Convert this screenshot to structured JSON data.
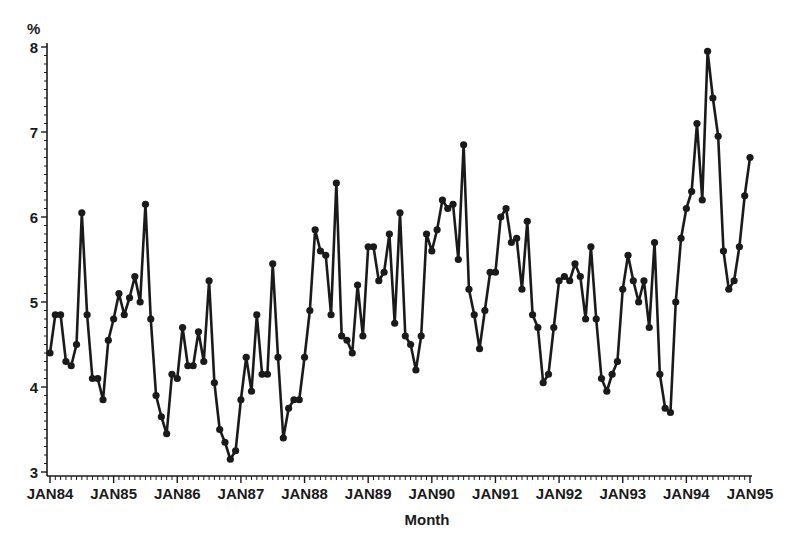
{
  "chart_data": {
    "type": "line",
    "title": "",
    "xlabel": "Month",
    "ylabel": "%",
    "ylim": [
      3,
      8
    ],
    "xlim": [
      "JAN84",
      "JAN95"
    ],
    "grid": false,
    "legend": null,
    "marker": "circle",
    "line_color": "#1a1a1a",
    "y_ticks": [
      3,
      4,
      5,
      6,
      7,
      8
    ],
    "y_minor_ticks_per_unit": 10,
    "x_tick_labels": [
      "JAN84",
      "JAN85",
      "JAN86",
      "JAN87",
      "JAN88",
      "JAN89",
      "JAN90",
      "JAN91",
      "JAN92",
      "JAN93",
      "JAN94",
      "JAN95"
    ],
    "x_minor_ticks_per_year": 12,
    "x_start": "JAN84",
    "x_frequency": "monthly",
    "series": [
      {
        "name": "%",
        "values": [
          4.4,
          4.85,
          4.85,
          4.3,
          4.25,
          4.5,
          6.05,
          4.85,
          4.1,
          4.1,
          3.85,
          4.55,
          4.8,
          5.1,
          4.85,
          5.05,
          5.3,
          5.0,
          6.15,
          4.8,
          3.9,
          3.65,
          3.45,
          4.15,
          4.1,
          4.7,
          4.25,
          4.25,
          4.65,
          4.3,
          5.25,
          4.05,
          3.5,
          3.35,
          3.15,
          3.25,
          3.85,
          4.35,
          3.95,
          4.85,
          4.15,
          4.15,
          5.45,
          4.35,
          3.4,
          3.75,
          3.85,
          3.85,
          4.35,
          4.9,
          5.85,
          5.6,
          5.55,
          4.85,
          6.4,
          4.6,
          4.55,
          4.4,
          5.2,
          4.6,
          5.65,
          5.65,
          5.25,
          5.35,
          5.8,
          4.75,
          6.05,
          4.6,
          4.5,
          4.2,
          4.6,
          5.8,
          5.6,
          5.85,
          6.2,
          6.1,
          6.15,
          5.5,
          6.85,
          5.15,
          4.85,
          4.45,
          4.9,
          5.35,
          5.35,
          6.0,
          6.1,
          5.7,
          5.75,
          5.15,
          5.95,
          4.85,
          4.7,
          4.05,
          4.15,
          4.7,
          5.25,
          5.3,
          5.25,
          5.45,
          5.3,
          4.8,
          5.65,
          4.8,
          4.1,
          3.95,
          4.15,
          4.3,
          5.15,
          5.55,
          5.25,
          5.0,
          5.25,
          4.7,
          5.7,
          4.15,
          3.75,
          3.7,
          5.0,
          5.75,
          6.1,
          6.3,
          7.1,
          6.2,
          7.95,
          7.4,
          6.95,
          5.6,
          5.15,
          5.25,
          5.65,
          6.25,
          6.7
        ]
      }
    ]
  },
  "axes": {
    "y_unit_label": "%",
    "x_title": "Month"
  }
}
